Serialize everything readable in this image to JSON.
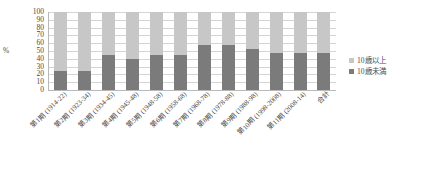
{
  "chart_data": {
    "type": "bar",
    "title": "",
    "subtitle": "",
    "xlabel": "",
    "ylabel": "%",
    "ylim": [
      0,
      100
    ],
    "yticks": [
      100,
      90,
      80,
      70,
      60,
      50,
      40,
      30,
      20,
      10,
      0
    ],
    "grid": true,
    "stacked": true,
    "stack_total": 100,
    "legend_position": "right",
    "categories": [
      "第1期 (1914-22)",
      "第2期 (1923-34)",
      "第3期 (1934-45)",
      "第4期 (1945-48)",
      "第5期 (1948-58)",
      "第6期 (1958-68)",
      "第7期 (1968-78)",
      "第8期 (1978-88)",
      "第9期 (1988-98)",
      "第10期 (1998-2008)",
      "第11期 (2008-14)",
      "合計"
    ],
    "series": [
      {
        "name": "10歳未満",
        "color": "#7b7b7b",
        "values": [
          24,
          24,
          45,
          40,
          45,
          45,
          58,
          58,
          52,
          47,
          47,
          47
        ]
      },
      {
        "name": "10歳以上",
        "color": "#c7c7c7",
        "values": [
          76,
          76,
          55,
          60,
          55,
          55,
          42,
          42,
          48,
          53,
          53,
          53
        ]
      }
    ]
  },
  "legend": {
    "items": [
      {
        "label": "10歳以上",
        "color": "#c7c7c7"
      },
      {
        "label": "10歳未満",
        "color": "#7b7b7b"
      }
    ]
  },
  "axis": {
    "y_title": "%"
  },
  "colors": {
    "upper_series": "#c7c7c7",
    "lower_series": "#7b7b7b",
    "gridline": "#d4d4d4",
    "axis": "#b8b8b8",
    "text": "#4a4a4a",
    "background": "#ffffff"
  }
}
